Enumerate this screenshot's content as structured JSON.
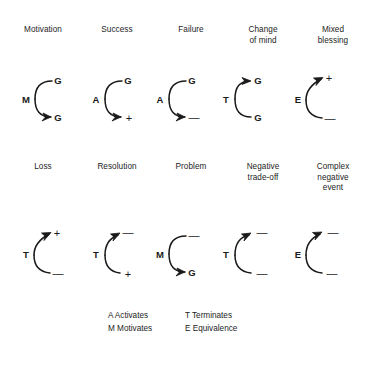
{
  "figure": {
    "title_present": false,
    "background": "#ffffff",
    "stroke_color": "#1a1a1a",
    "text_color": "#1d1d1d"
  },
  "rows": [
    {
      "headers": [
        {
          "label": "Motivation"
        },
        {
          "label": "Success"
        },
        {
          "label": "Failure"
        },
        {
          "label": "Change\nof mind"
        },
        {
          "label": "Mixed\nblessing"
        }
      ],
      "diagrams": [
        {
          "name": "motivation",
          "source": "M",
          "upper": {
            "node": "G",
            "arrow": false
          },
          "lower": {
            "node": "G",
            "arrow": true
          }
        },
        {
          "name": "success",
          "source": "A",
          "upper": {
            "node": "G",
            "arrow": false
          },
          "lower": {
            "node": "+",
            "arrow": true
          }
        },
        {
          "name": "failure",
          "source": "A",
          "upper": {
            "node": "G",
            "arrow": false
          },
          "lower": {
            "node": "—",
            "arrow": true
          }
        },
        {
          "name": "change-of-mind",
          "source": "T",
          "upper": {
            "node": "G",
            "arrow": true
          },
          "lower": {
            "node": "G",
            "arrow": false
          }
        },
        {
          "name": "mixed-blessing",
          "source": "E",
          "upper": {
            "node": "+",
            "arrow": true
          },
          "lower": {
            "node": "—",
            "arrow": false
          }
        }
      ]
    },
    {
      "headers": [
        {
          "label": "Loss"
        },
        {
          "label": "Resolution"
        },
        {
          "label": "Problem"
        },
        {
          "label": "Negative\ntrade-off"
        },
        {
          "label": "Complex\nnegative\nevent"
        }
      ],
      "diagrams": [
        {
          "name": "loss",
          "source": "T",
          "upper": {
            "node": "+",
            "arrow": true
          },
          "lower": {
            "node": "—",
            "arrow": false
          }
        },
        {
          "name": "resolution",
          "source": "T",
          "upper": {
            "node": "—",
            "arrow": true
          },
          "lower": {
            "node": "+",
            "arrow": false
          }
        },
        {
          "name": "problem",
          "source": "M",
          "upper": {
            "node": "—",
            "arrow": false
          },
          "lower": {
            "node": "G",
            "arrow": true
          }
        },
        {
          "name": "negative-trade-off",
          "source": "T",
          "upper": {
            "node": "—",
            "arrow": true
          },
          "lower": {
            "node": "—",
            "arrow": false
          }
        },
        {
          "name": "complex-negative-event",
          "source": "E",
          "upper": {
            "node": "—",
            "arrow": true
          },
          "lower": {
            "node": "—",
            "arrow": false
          }
        }
      ]
    }
  ],
  "legend": {
    "column_left": "A Activates\nM Motivates",
    "column_right": "T Terminates\nE Equivalence",
    "entries": [
      {
        "key": "A",
        "meaning": "Activates"
      },
      {
        "key": "M",
        "meaning": "Motivates"
      },
      {
        "key": "T",
        "meaning": "Terminates"
      },
      {
        "key": "E",
        "meaning": "Equivalence"
      }
    ]
  }
}
